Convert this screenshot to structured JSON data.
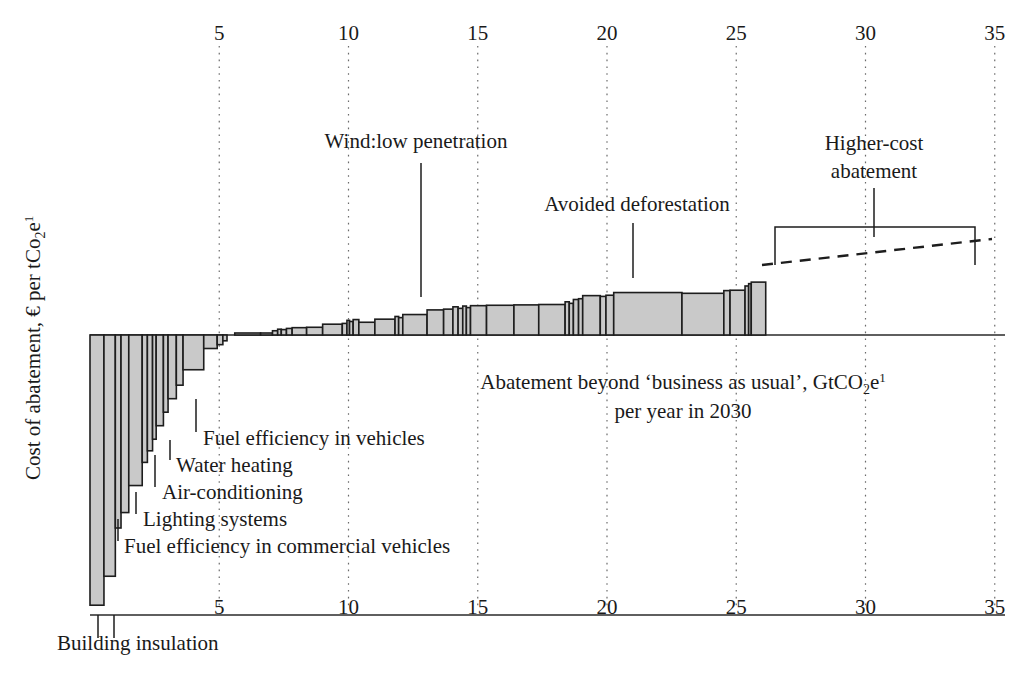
{
  "chart_data": {
    "type": "bar",
    "title": "",
    "subtitle": "",
    "xlabel": "Abatement beyond 'business as usual', GtCO₂2e¹ per year in 2030",
    "xlabel_line1": "Abatement beyond ‘business as usual’, GtCO",
    "xlabel_line1_sub": "2",
    "xlabel_line1_tail": "e",
    "xlabel_line1_sup": "1",
    "xlabel_line2": "per year in 2030",
    "ylabel": "Cost of abatement, € per tCo₂2e¹",
    "ylabel_main": "Cost of abatement, € per tCo",
    "ylabel_sub": "2",
    "ylabel_tail": "e",
    "ylabel_sup": "1",
    "xlim": [
      0,
      35.5
    ],
    "x_ticks": [
      5,
      10,
      15,
      20,
      25,
      30,
      35
    ],
    "x_tick_labels": [
      "5",
      "10",
      "15",
      "20",
      "25",
      "30",
      "35"
    ],
    "grid": true,
    "grid_style": "dotted-vertical",
    "legend": "none",
    "bar_fill_color": "#c9c9c9",
    "bar_stroke_color": "#1d1d1d",
    "axis_color": "#2a2a2a",
    "negative_bars": [
      {
        "label": "Building insulation",
        "x_start": 0.0,
        "width": 0.54,
        "cost": -140
      },
      {
        "label": "Building insulation",
        "x_start": 0.54,
        "width": 0.44,
        "cost": -125
      },
      {
        "label": "Fuel efficiency in commercial vehicles",
        "x_start": 0.98,
        "width": 0.22,
        "cost": -100
      },
      {
        "label": "",
        "x_start": 1.2,
        "width": 0.3,
        "cost": -92
      },
      {
        "label": "Lighting systems",
        "x_start": 1.5,
        "width": 0.52,
        "cost": -78
      },
      {
        "label": "",
        "x_start": 2.02,
        "width": 0.2,
        "cost": -66
      },
      {
        "label": "Air-conditioning",
        "x_start": 2.22,
        "width": 0.2,
        "cost": -60
      },
      {
        "label": "",
        "x_start": 2.42,
        "width": 0.14,
        "cost": -54
      },
      {
        "label": "Water heating",
        "x_start": 2.56,
        "width": 0.28,
        "cost": -47
      },
      {
        "label": "",
        "x_start": 2.84,
        "width": 0.18,
        "cost": -40
      },
      {
        "label": "Fuel efficiency in vehicles",
        "x_start": 3.02,
        "width": 0.32,
        "cost": -33
      },
      {
        "label": "",
        "x_start": 3.34,
        "width": 0.26,
        "cost": -26
      },
      {
        "label": "",
        "x_start": 3.6,
        "width": 0.8,
        "cost": -18
      },
      {
        "label": "",
        "x_start": 4.4,
        "width": 0.52,
        "cost": -7
      },
      {
        "label": "",
        "x_start": 4.92,
        "width": 0.22,
        "cost": -5
      },
      {
        "label": "",
        "x_start": 5.14,
        "width": 0.16,
        "cost": -3
      }
    ],
    "positive_bars": [
      {
        "x_start": 5.6,
        "width": 1.0,
        "cost": 0.6
      },
      {
        "x_start": 6.6,
        "width": 0.46,
        "cost": 0.9
      },
      {
        "x_start": 7.06,
        "width": 0.2,
        "cost": 2.2
      },
      {
        "x_start": 7.26,
        "width": 0.14,
        "cost": 3.0
      },
      {
        "x_start": 7.4,
        "width": 0.2,
        "cost": 2.8
      },
      {
        "x_start": 7.6,
        "width": 0.22,
        "cost": 3.4
      },
      {
        "x_start": 7.82,
        "width": 0.56,
        "cost": 3.8
      },
      {
        "x_start": 8.38,
        "width": 0.62,
        "cost": 4.0
      },
      {
        "x_start": 9.0,
        "width": 0.76,
        "cost": 5.6
      },
      {
        "x_start": 9.76,
        "width": 0.18,
        "cost": 6.0
      },
      {
        "x_start": 9.94,
        "width": 0.1,
        "cost": 7.6
      },
      {
        "x_start": 10.04,
        "width": 0.14,
        "cost": 7.0
      },
      {
        "x_start": 10.18,
        "width": 0.22,
        "cost": 8.0
      },
      {
        "x_start": 10.4,
        "width": 0.62,
        "cost": 6.6
      },
      {
        "x_start": 11.02,
        "width": 0.78,
        "cost": 8.2
      },
      {
        "x_start": 11.8,
        "width": 0.14,
        "cost": 9.6
      },
      {
        "x_start": 11.94,
        "width": 0.16,
        "cost": 9.0
      },
      {
        "x_start": 12.1,
        "width": 0.94,
        "cost": 10.6
      },
      {
        "x_start": 13.04,
        "width": 0.64,
        "cost": 13.0
      },
      {
        "x_start": 13.68,
        "width": 0.36,
        "cost": 13.4
      },
      {
        "x_start": 14.04,
        "width": 0.2,
        "cost": 14.6
      },
      {
        "x_start": 14.24,
        "width": 0.18,
        "cost": 13.8
      },
      {
        "x_start": 14.42,
        "width": 0.14,
        "cost": 15.0
      },
      {
        "x_start": 14.56,
        "width": 0.16,
        "cost": 14.2
      },
      {
        "x_start": 14.72,
        "width": 0.62,
        "cost": 15.2
      },
      {
        "x_start": 15.34,
        "width": 1.06,
        "cost": 15.4
      },
      {
        "x_start": 16.4,
        "width": 0.96,
        "cost": 15.6
      },
      {
        "x_start": 17.36,
        "width": 1.02,
        "cost": 15.8
      },
      {
        "x_start": 18.38,
        "width": 0.16,
        "cost": 17.2
      },
      {
        "x_start": 18.54,
        "width": 0.16,
        "cost": 16.4
      },
      {
        "x_start": 18.7,
        "width": 0.2,
        "cost": 18.4
      },
      {
        "x_start": 18.9,
        "width": 0.16,
        "cost": 18.8
      },
      {
        "x_start": 19.06,
        "width": 0.68,
        "cost": 20.4
      },
      {
        "x_start": 19.74,
        "width": 0.22,
        "cost": 20.0
      },
      {
        "x_start": 19.96,
        "width": 0.3,
        "cost": 20.6
      },
      {
        "x_start": 20.26,
        "width": 2.64,
        "cost": 22.0,
        "label": "Avoided deforestation"
      },
      {
        "x_start": 22.9,
        "width": 1.62,
        "cost": 21.6
      },
      {
        "x_start": 24.52,
        "width": 0.24,
        "cost": 23.0
      },
      {
        "x_start": 24.76,
        "width": 0.58,
        "cost": 23.2
      },
      {
        "x_start": 25.34,
        "width": 0.14,
        "cost": 25.4
      },
      {
        "x_start": 25.48,
        "width": 0.1,
        "cost": 26.6
      },
      {
        "x_start": 25.58,
        "width": 0.56,
        "cost": 27.4
      }
    ],
    "annotations": [
      {
        "name": "wind-low-penetration",
        "text": "Wind:low penetration",
        "text_x": 416,
        "text_y": 148,
        "leader": {
          "x1": 421,
          "y1": 163,
          "x2": 421,
          "y2": 297
        }
      },
      {
        "name": "avoided-deforestation",
        "text": "Avoided deforestation",
        "text_x": 637,
        "text_y": 211,
        "leader": {
          "x1": 633,
          "y1": 223,
          "x2": 633,
          "y2": 278
        }
      },
      {
        "name": "higher-cost-abatement",
        "text_line1": "Higher-cost",
        "text_line2": "abatement",
        "text_x": 874,
        "text_y": 150,
        "leader": {
          "x1": 874,
          "y1": 188,
          "x2": 874,
          "y2": 237
        }
      },
      {
        "name": "fuel-efficiency-in-vehicles",
        "text": "Fuel efficiency in vehicles",
        "text_x": 203,
        "text_y": 445,
        "leader": {
          "x1": 196,
          "y1": 399,
          "x2": 196,
          "y2": 432
        }
      },
      {
        "name": "water-heating",
        "text": "Water heating",
        "text_x": 176,
        "text_y": 472,
        "leader": {
          "x1": 170,
          "y1": 440,
          "x2": 170,
          "y2": 460
        }
      },
      {
        "name": "air-conditioning",
        "text": "Air-conditioning",
        "text_x": 162,
        "text_y": 499,
        "leader": {
          "x1": 155,
          "y1": 455,
          "x2": 155,
          "y2": 487
        }
      },
      {
        "name": "lighting-systems",
        "text": "Lighting systems",
        "text_x": 143,
        "text_y": 526,
        "leader": {
          "x1": 136,
          "y1": 492,
          "x2": 136,
          "y2": 514
        }
      },
      {
        "name": "fuel-efficiency-in-commercial-vehicles",
        "text": "Fuel efficiency in commercial vehicles",
        "text_x": 124,
        "text_y": 553,
        "leader": {
          "x1": 118,
          "y1": 519,
          "x2": 118,
          "y2": 541
        }
      },
      {
        "name": "building-insulation",
        "text": "Building insulation",
        "text_x": 57,
        "text_y": 650,
        "leader1": {
          "x1": 98,
          "y1": 615,
          "x2": 98,
          "y2": 638
        },
        "leader2": {
          "x1": 114,
          "y1": 615,
          "x2": 114,
          "y2": 638
        }
      }
    ],
    "bracket": {
      "x_left": 775,
      "x_right": 975,
      "y_top": 227,
      "y_tip": 265,
      "stem_y": 237
    },
    "dashed_extrapolation": {
      "x1": 762,
      "y1": 265,
      "x2": 992,
      "y2": 239
    }
  },
  "axes": {
    "top_ticks": [
      "5",
      "10",
      "15",
      "20",
      "25",
      "30",
      "35"
    ],
    "bottom_ticks": [
      "5",
      "10",
      "15",
      "20",
      "25",
      "30",
      "35"
    ]
  }
}
